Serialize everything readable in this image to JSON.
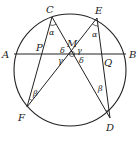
{
  "diagram": {
    "type": "butterfly-theorem",
    "circle": {
      "cx": 70,
      "cy": 70,
      "r": 56
    },
    "points": {
      "A": {
        "x": 14,
        "y": 54,
        "label": "A"
      },
      "B": {
        "x": 126,
        "y": 54,
        "label": "B"
      },
      "C": {
        "x": 52,
        "y": 17,
        "label": "C"
      },
      "E": {
        "x": 97,
        "y": 18,
        "label": "E"
      },
      "F": {
        "x": 27,
        "y": 107,
        "label": "F"
      },
      "D": {
        "x": 110,
        "y": 118,
        "label": "D"
      },
      "M": {
        "x": 72,
        "y": 54,
        "label": "M"
      },
      "P": {
        "x": 41,
        "y": 54,
        "label": "P"
      },
      "Q": {
        "x": 102,
        "y": 54,
        "label": "Q"
      }
    },
    "segments": [
      [
        "A",
        "B"
      ],
      [
        "C",
        "F"
      ],
      [
        "C",
        "D"
      ],
      [
        "E",
        "F"
      ],
      [
        "E",
        "D"
      ]
    ],
    "angle_labels": {
      "alpha_C": "α",
      "alpha_E": "α",
      "beta_F": "β",
      "beta_D": "β",
      "delta_upper": "δ",
      "delta_lower": "δ",
      "gamma_upper": "γ",
      "gamma_lower": "γ"
    }
  }
}
